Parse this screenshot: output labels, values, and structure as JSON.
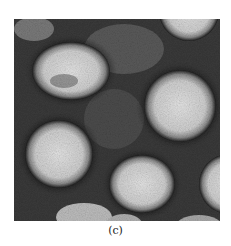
{
  "figure": {
    "caption": "(c)",
    "image_description": "grayscale transmission electron micrograph of spherical virus particles with spiky surface projections on a dark background",
    "colors": {
      "background": "#2a2a2a",
      "particle": "#d8d8d8",
      "spike_ring": "#1a1a1a"
    }
  }
}
